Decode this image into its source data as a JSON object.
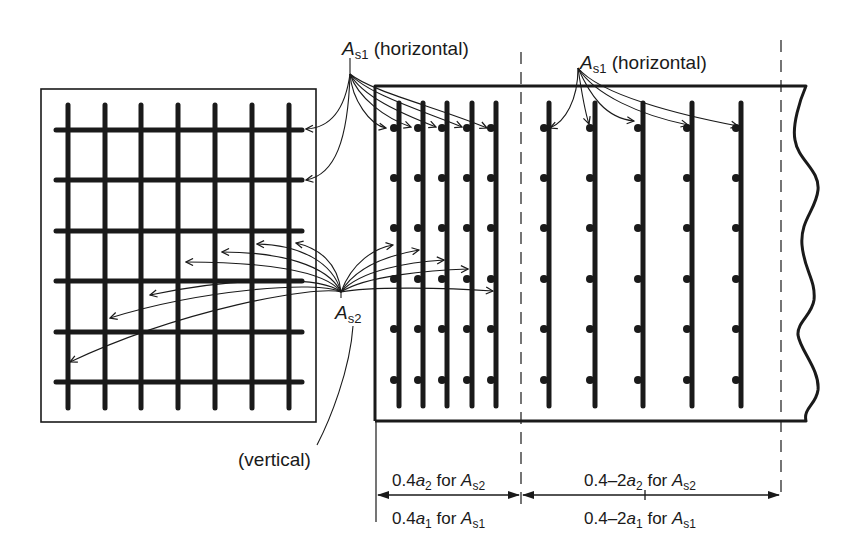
{
  "diagram": {
    "colors": {
      "ink": "#1a1a1a",
      "background": "#ffffff"
    },
    "labels": {
      "as1_top_left": {
        "symbol": "A",
        "sub": "s1",
        "text": " (horizontal)"
      },
      "as1_top_right": {
        "symbol": "A",
        "sub": "s1",
        "text": " (horizontal)"
      },
      "as2": {
        "symbol": "A",
        "sub": "s2"
      },
      "vertical": "(vertical)"
    },
    "dimensions": {
      "left_upper": {
        "prefix": "0.4",
        "var": "a",
        "var_sub": "2",
        "mid": " for ",
        "sym": "A",
        "sym_sub": "s2"
      },
      "left_lower": {
        "prefix": "0.4",
        "var": "a",
        "var_sub": "1",
        "mid": " for ",
        "sym": "A",
        "sym_sub": "s1"
      },
      "right_upper": {
        "prefix": "0.4–2",
        "var": "a",
        "var_sub": "2",
        "mid": " for ",
        "sym": "A",
        "sym_sub": "s2"
      },
      "right_lower": {
        "prefix": "0.4–2",
        "var": "a",
        "var_sub": "1",
        "mid": " for ",
        "sym": "A",
        "sym_sub": "s1"
      }
    },
    "mesh": {
      "vertical_bars_x": [
        68,
        105,
        141,
        178,
        215,
        252,
        289
      ],
      "horizontal_bars_y": [
        130,
        180,
        231,
        281,
        332,
        382
      ]
    },
    "section": {
      "dense_bars_x": [
        399,
        423,
        447,
        472,
        496
      ],
      "sparse_bars_x": [
        549,
        595,
        643,
        692,
        741
      ],
      "dot_rows_y": [
        128,
        178,
        228,
        279,
        329,
        380
      ]
    }
  }
}
